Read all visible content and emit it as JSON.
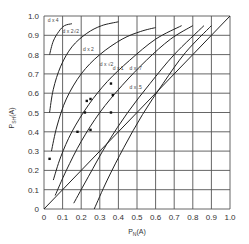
{
  "chart_data": {
    "type": "line",
    "title": "",
    "xlabel": "P_N(A)",
    "ylabel": "P_SH(A)",
    "xlim": [
      0,
      1.0
    ],
    "ylim": [
      0,
      1.0
    ],
    "grid": true,
    "x_ticks": [
      "0",
      "0.1",
      "0.2",
      "0.3",
      "0.4",
      "0.5",
      "0.6",
      "0.7",
      "0.8",
      "0.9",
      "1.0"
    ],
    "y_ticks": [
      "0",
      "0.1",
      "0.2",
      "0.3",
      "0.4",
      "0.5",
      "0.6",
      "0.7",
      "0.8",
      "0.9",
      "1.0"
    ],
    "series": [
      {
        "name": "d x 4",
        "label_pos": [
          0.02,
          0.97
        ],
        "points": [
          [
            0.03,
            0.8
          ],
          [
            0.05,
            0.87
          ],
          [
            0.08,
            0.92
          ],
          [
            0.11,
            0.95
          ],
          [
            0.15,
            0.96
          ]
        ]
      },
      {
        "name": "d x 2√2",
        "label_pos": [
          0.1,
          0.91
        ],
        "points": [
          [
            0.03,
            0.5
          ],
          [
            0.05,
            0.62
          ],
          [
            0.09,
            0.74
          ],
          [
            0.15,
            0.84
          ],
          [
            0.23,
            0.91
          ],
          [
            0.31,
            0.95
          ],
          [
            0.4,
            0.97
          ]
        ]
      },
      {
        "name": "d x 2",
        "label_pos": [
          0.21,
          0.82
        ],
        "points": [
          [
            0.04,
            0.3
          ],
          [
            0.07,
            0.43
          ],
          [
            0.12,
            0.57
          ],
          [
            0.2,
            0.7
          ],
          [
            0.3,
            0.8
          ],
          [
            0.42,
            0.88
          ],
          [
            0.52,
            0.92
          ],
          [
            0.6,
            0.94
          ]
        ]
      },
      {
        "name": "d x √2",
        "label_pos": [
          0.3,
          0.74
        ],
        "points": [
          [
            0.05,
            0.15
          ],
          [
            0.09,
            0.27
          ],
          [
            0.15,
            0.4
          ],
          [
            0.24,
            0.54
          ],
          [
            0.34,
            0.66
          ],
          [
            0.46,
            0.77
          ],
          [
            0.6,
            0.88
          ],
          [
            0.74,
            0.95
          ]
        ]
      },
      {
        "name": "d x 1",
        "label_pos": [
          0.37,
          0.72
        ],
        "points": [
          [
            0.06,
            0.07
          ],
          [
            0.12,
            0.2
          ],
          [
            0.2,
            0.35
          ],
          [
            0.3,
            0.5
          ],
          [
            0.42,
            0.64
          ],
          [
            0.55,
            0.77
          ],
          [
            0.68,
            0.88
          ],
          [
            0.8,
            0.95
          ]
        ]
      },
      {
        "name": "d x .7",
        "label_pos": [
          0.46,
          0.72
        ],
        "points": [
          [
            0.16,
            0.03
          ],
          [
            0.24,
            0.17
          ],
          [
            0.34,
            0.34
          ],
          [
            0.45,
            0.5
          ],
          [
            0.57,
            0.65
          ],
          [
            0.7,
            0.8
          ],
          [
            0.86,
            0.95
          ]
        ]
      },
      {
        "name": "d x .5",
        "label_pos": [
          0.46,
          0.62
        ],
        "points": [
          [
            0.27,
            0.0
          ],
          [
            0.34,
            0.15
          ],
          [
            0.43,
            0.32
          ],
          [
            0.53,
            0.49
          ],
          [
            0.64,
            0.65
          ],
          [
            0.76,
            0.81
          ],
          [
            0.9,
            0.95
          ]
        ]
      },
      {
        "name": "diagonal",
        "points": [
          [
            0,
            0
          ],
          [
            1,
            1
          ]
        ]
      }
    ],
    "scatter_points": [
      [
        0.03,
        0.26
      ],
      [
        0.18,
        0.4
      ],
      [
        0.22,
        0.5
      ],
      [
        0.23,
        0.56
      ],
      [
        0.25,
        0.57
      ],
      [
        0.25,
        0.41
      ],
      [
        0.36,
        0.5
      ],
      [
        0.36,
        0.65
      ],
      [
        0.37,
        0.59
      ]
    ]
  }
}
